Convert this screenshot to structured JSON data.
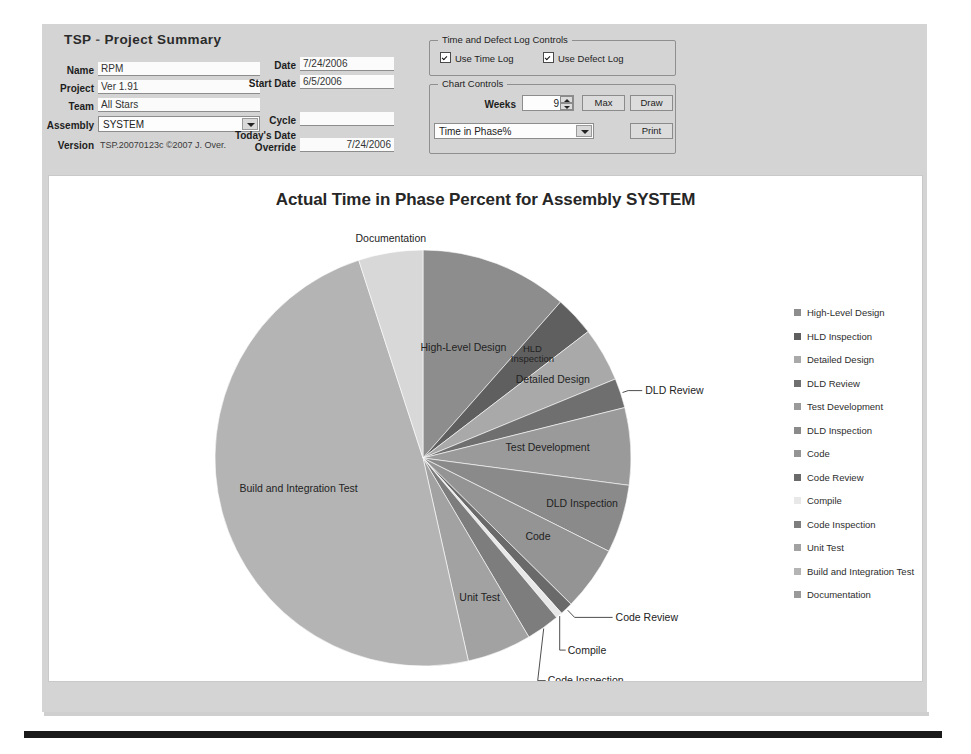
{
  "app": {
    "title_prefix": "TSP",
    "title_dash": "-",
    "title_main": "Project Summary"
  },
  "form": {
    "fields": [
      {
        "label": "Name",
        "value": "RPM"
      },
      {
        "label": "Project",
        "value": "Ver 1.91"
      },
      {
        "label": "Team",
        "value": "All Stars"
      }
    ],
    "assembly": {
      "label": "Assembly",
      "value": "SYSTEM"
    },
    "version": {
      "label": "Version",
      "value": "TSP.20070123c  ©2007 J. Over."
    },
    "dates": [
      {
        "label": "Date",
        "value": "7/24/2006"
      },
      {
        "label": "Start Date",
        "value": "6/5/2006"
      }
    ],
    "cycle": {
      "label": "Cycle",
      "value": ""
    },
    "today_override": {
      "label_line1": "Today's Date",
      "label_line2": "Override",
      "value": "7/24/2006"
    }
  },
  "log_controls": {
    "legend": "Time and Defect Log Controls",
    "use_time_log": "Use Time Log",
    "use_defect_log": "Use Defect Log",
    "use_time_log_checked": true,
    "use_defect_log_checked": true
  },
  "chart_controls": {
    "legend": "Chart Controls",
    "weeks_label": "Weeks",
    "weeks_value": "9",
    "max_button": "Max",
    "draw_button": "Draw",
    "print_button": "Print",
    "chart_select_value": "Time in Phase%"
  },
  "chart_data": {
    "type": "pie",
    "title": "Actual Time in Phase Percent for Assembly SYSTEM",
    "xlabel": "",
    "ylabel": "",
    "legend_position": "right",
    "grid": false,
    "units": "percent",
    "categories": [
      "High-Level Design",
      "HLD Inspection",
      "Detailed Design",
      "DLD Review",
      "Test Development",
      "DLD Inspection",
      "Code",
      "Code Review",
      "Compile",
      "Code Inspection",
      "Unit Test",
      "Build and Integration Test",
      "Documentation"
    ],
    "values": [
      11.5,
      3.1,
      4.2,
      2.3,
      6.0,
      5.3,
      5.0,
      1.0,
      0.5,
      2.6,
      5.0,
      48.5,
      5.0
    ],
    "colors": [
      "#8d8d8d",
      "#5f5f5f",
      "#a9a9a9",
      "#6f6f6f",
      "#9a9a9a",
      "#8a8a8a",
      "#949494",
      "#6a6a6a",
      "#e8e8e8",
      "#7d7d7d",
      "#a2a2a2",
      "#b4b4b4",
      "#d8d8d8"
    ],
    "legend_entries": [
      "High-Level Design",
      "HLD Inspection",
      "Detailed Design",
      "DLD Review",
      "Test Development",
      "DLD Inspection",
      "Code",
      "Code Review",
      "Compile",
      "Code Inspection",
      "Unit Test",
      "Build and Integration Test",
      "Documentation"
    ],
    "legend_marker_colors": [
      "#8d8d8d",
      "#5f5f5f",
      "#a9a9a9",
      "#6f6f6f",
      "#9a9a9a",
      "#8a8a8a",
      "#949494",
      "#6a6a6a",
      "#e8e8e8",
      "#7d7d7d",
      "#a2a2a2",
      "#b4b4b4"
    ],
    "slice_labels": [
      "Documentation",
      "High-Level Design",
      "HLD Inspection",
      "Detailed Design",
      "DLD Review",
      "Test Development",
      "DLD Inspection",
      "Code",
      "Code Review",
      "Code Inspection",
      "Compile",
      "Unit Test",
      "Build and Integration Test"
    ]
  }
}
